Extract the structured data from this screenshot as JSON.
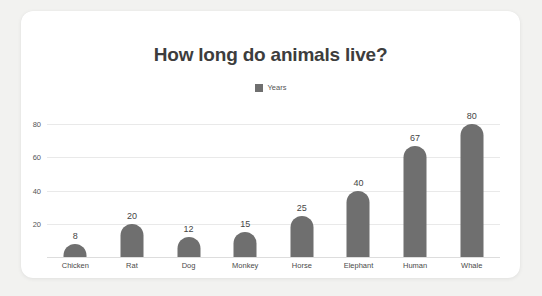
{
  "chart_data": {
    "type": "bar",
    "title": "How long do animals live?",
    "categories": [
      "Chicken",
      "Rat",
      "Dog",
      "Monkey",
      "Horse",
      "Elephant",
      "Human",
      "Whale"
    ],
    "values": [
      8,
      20,
      12,
      15,
      25,
      40,
      67,
      80
    ],
    "series": [
      {
        "name": "Years",
        "values": [
          8,
          20,
          12,
          15,
          25,
          40,
          67,
          80
        ]
      }
    ],
    "xlabel": "",
    "ylabel": "",
    "ylim": [
      0,
      88
    ],
    "yticks": [
      20,
      40,
      60,
      80
    ],
    "grid": true,
    "legend": {
      "position": "top",
      "entries": [
        {
          "label": "Years",
          "color": "#6f6f6f"
        }
      ]
    },
    "show_value_labels": true
  },
  "colors": {
    "bar": "#6f6f6f",
    "gridline": "#e9e9e9",
    "axis": "#dddddd",
    "title_text": "#3d3d3d",
    "tick_text": "#555555",
    "value_text": "#454545",
    "card_background": "#ffffff",
    "page_background": "#f2f2f0"
  }
}
